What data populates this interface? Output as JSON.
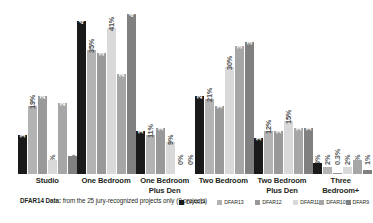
{
  "chart_data": {
    "type": "bar",
    "title": "",
    "xlabel": "",
    "ylabel": "",
    "ylim": [
      0,
      45
    ],
    "grid": false,
    "legend_position": "bottom-right",
    "categories": [
      "Studio",
      "One Bedroom",
      "One Bedroom Plus Den",
      "Two Bedroom",
      "Two Bedroom Plus Den",
      "Three Bedroom+"
    ],
    "category_lines": [
      [
        "Studio"
      ],
      [
        "One Bedroom"
      ],
      [
        "One Bedroom",
        "Plus Den"
      ],
      [
        "Two Bedroom"
      ],
      [
        "Two Bedroom",
        "Plus Den"
      ],
      [
        "Three Bedroom+"
      ]
    ],
    "series": [
      {
        "name": "DFAR14",
        "color": "#1a1a1a",
        "values": [
          11,
          43,
          12,
          22,
          10,
          3
        ],
        "labels": [
          "11%",
          "43%",
          "12%",
          "22%",
          "10%",
          "3%"
        ]
      },
      {
        "name": "DFAR13",
        "color": "#b3b3b3",
        "values": [
          19,
          35,
          11,
          21,
          12,
          2
        ],
        "labels": [
          "19%",
          "35%",
          "11%",
          "21%",
          "12%",
          "2%"
        ]
      },
      {
        "name": "DFAR12",
        "color": "#999999",
        "values": [
          22,
          34,
          13,
          19,
          12,
          0.3
        ],
        "labels": [
          "22%",
          "34%",
          "13%",
          "19%",
          "12%",
          "0.3%"
        ]
      },
      {
        "name": "DFAR11",
        "color": "#d9d9d9",
        "values": [
          4,
          41,
          9,
          30,
          15,
          2
        ],
        "labels": [
          "4%",
          "41%",
          "9%",
          "30%",
          "15%",
          "2%"
        ]
      },
      {
        "name": "DFAR10",
        "color": "#a6a6a6",
        "values": [
          20,
          28,
          0,
          36,
          13,
          4
        ],
        "labels": [
          "20%",
          "28%",
          "0%",
          "36%",
          "13%",
          "4%"
        ]
      },
      {
        "name": "DFAR9",
        "color": "#808080",
        "values": [
          5,
          45,
          0,
          37,
          13,
          1
        ],
        "labels": [
          "5%",
          "45%",
          "0%",
          "37%",
          "13%",
          "1%"
        ]
      }
    ]
  },
  "footnote": {
    "bold_prefix": "DFAR14 Data:",
    "rest": " from the 25 jury-recognized projects only (9 projects)"
  }
}
